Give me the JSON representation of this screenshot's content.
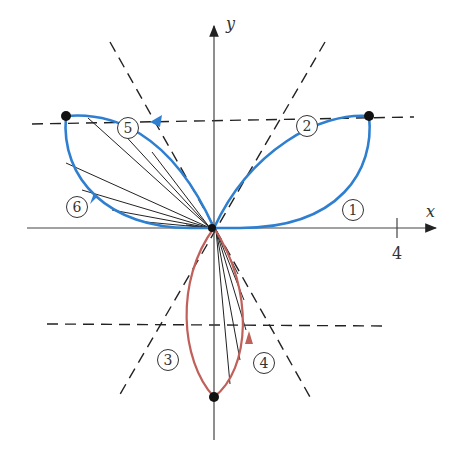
{
  "figure": {
    "origin": [
      214,
      228
    ],
    "colors": {
      "upper_petals": "#2f7fd0",
      "lower_petal": "#c0605a",
      "axes": "#444444",
      "dashed": "#222222",
      "chords": "#222222",
      "points": "#111111"
    },
    "axes": {
      "x_label": "x",
      "y_label": "y",
      "x_tick_value": "4",
      "x_axis": {
        "from": [
          27,
          228
        ],
        "to": [
          438,
          228
        ]
      },
      "y_axis": {
        "from": [
          214,
          440
        ],
        "to": [
          214,
          24
        ]
      },
      "x_tick_px": 397
    },
    "dashed_lines": [
      {
        "from": [
          32,
          124
        ],
        "to": [
          414,
          117
        ]
      },
      {
        "from": [
          110,
          42
        ],
        "to": [
          310,
          397
        ]
      },
      {
        "from": [
          325,
          42
        ],
        "to": [
          119,
          396
        ]
      },
      {
        "from": [
          47,
          324
        ],
        "to": [
          385,
          326
        ]
      }
    ],
    "petal_tips": [
      {
        "name": "tip-right",
        "at": [
          369,
          116
        ]
      },
      {
        "name": "tip-left",
        "at": [
          66,
          116
        ]
      },
      {
        "name": "tip-bottom",
        "at": [
          214,
          397
        ]
      }
    ],
    "stage_labels": [
      {
        "text": "1",
        "at": [
          353,
          210
        ]
      },
      {
        "text": "2",
        "at": [
          307,
          126
        ]
      },
      {
        "text": "3",
        "at": [
          168,
          360
        ]
      },
      {
        "text": "4",
        "at": [
          264,
          363
        ]
      },
      {
        "text": "5",
        "at": [
          128,
          128
        ]
      },
      {
        "text": "6",
        "at": [
          77,
          207
        ]
      }
    ]
  }
}
